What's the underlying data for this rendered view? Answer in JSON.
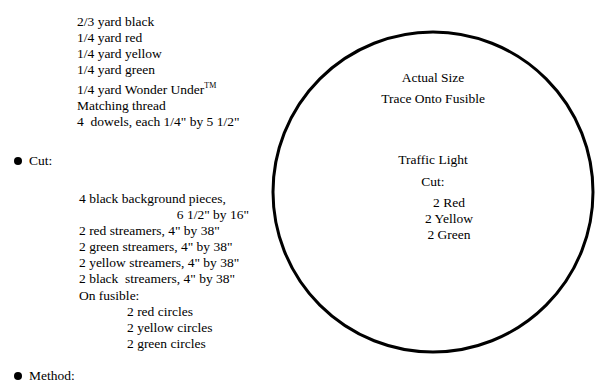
{
  "page": {
    "document_type": "sewing-pattern-instructions",
    "background_color": "#ffffff",
    "ink_color": "#000000"
  },
  "materials": {
    "lines": [
      "2/3 yard black",
      "1/4 yard red",
      "1/4 yard yellow",
      "1/4 yard green",
      "1/4 yard Wonder Under",
      "Matching thread",
      "4  dowels, each 1/4\" by 5 1/2\""
    ],
    "trademark_symbol": "TM",
    "trademark_on_line_index": 4
  },
  "sections": {
    "cut": {
      "bullet": "●",
      "label": "Cut:",
      "items": [
        {
          "text": "4 black background pieces,",
          "align": "left",
          "indent": false
        },
        {
          "text": "6 1/2\" by 16\"",
          "align": "right",
          "indent": false
        },
        {
          "text": "2 red streamers, 4\" by 38\"",
          "align": "left",
          "indent": false
        },
        {
          "text": "2 green streamers, 4\" by 38\"",
          "align": "left",
          "indent": false
        },
        {
          "text": "2 yellow streamers, 4\" by 38\"",
          "align": "left",
          "indent": false
        },
        {
          "text": "2 black  streamers, 4\" by 38\"",
          "align": "left",
          "indent": false
        },
        {
          "text": "On fusible:",
          "align": "left",
          "indent": false
        },
        {
          "text": "2 red circles",
          "align": "left",
          "indent": true
        },
        {
          "text": "2 yellow circles",
          "align": "left",
          "indent": true
        },
        {
          "text": "2 green circles",
          "align": "left",
          "indent": true
        }
      ]
    },
    "method": {
      "bullet": "●",
      "label": "Method:"
    }
  },
  "pattern_circle": {
    "shape": "circle",
    "stroke_color": "#000000",
    "stroke_width_px": 3,
    "fill": "none",
    "center_x_px": 433,
    "center_y_px": 192,
    "radius_px": 160,
    "labels": {
      "actual_size": "Actual Size",
      "trace_onto_fusible": "Trace Onto Fusible",
      "title": "Traffic Light",
      "cut_label": "Cut:",
      "colors": [
        "2 Red",
        "2 Yellow",
        "2 Green"
      ]
    }
  }
}
